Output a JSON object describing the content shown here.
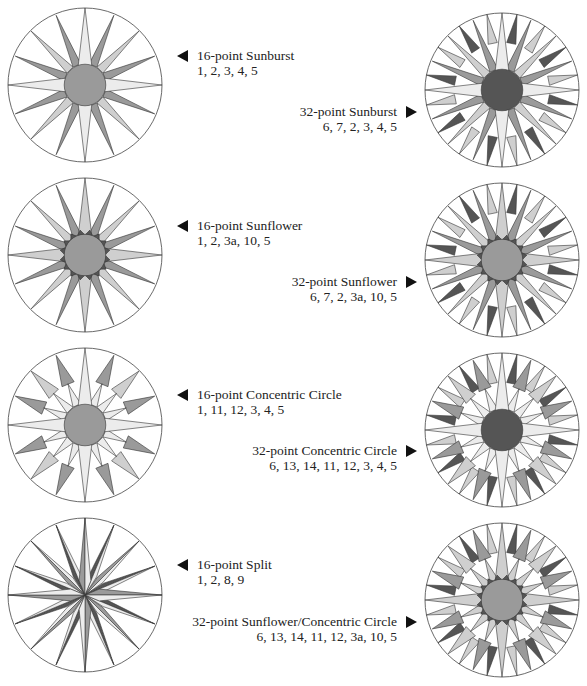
{
  "colors": {
    "ink": "#222222",
    "dark": "#555555",
    "medium": "#9a9a9a",
    "light": "#cfcfcf",
    "pale": "#ececec",
    "white": "#ffffff"
  },
  "diagrams": [
    {
      "id": "16-point-sunburst",
      "title": "16-point Sunburst",
      "codes": "1, 2, 3, 4, 5",
      "side": "left",
      "points": 16,
      "center_fill": "medium",
      "main_fill": "pale",
      "secondary_fill": "light",
      "tertiary_fill": "medium",
      "outer_fill": null,
      "ring_fill": null
    },
    {
      "id": "32-point-sunburst",
      "title": "32-point Sunburst",
      "codes": "6, 7, 2, 3, 4, 5",
      "side": "right",
      "points": 32,
      "center_fill": "dark",
      "main_fill": "pale",
      "secondary_fill": "light",
      "tertiary_fill": "medium",
      "outer_fill": "dark",
      "ring_fill": null
    },
    {
      "id": "16-point-sunflower",
      "title": "16-point Sunflower",
      "codes": "1, 2, 3a, 10, 5",
      "side": "left",
      "points": 16,
      "center_fill": "medium",
      "main_fill": "light",
      "secondary_fill": "light",
      "tertiary_fill": "medium",
      "outer_fill": null,
      "ring_fill": "dark"
    },
    {
      "id": "32-point-sunflower",
      "title": "32-point Sunflower",
      "codes": "6, 7, 2, 3a, 10, 5",
      "side": "right",
      "points": 32,
      "center_fill": "medium",
      "main_fill": "light",
      "secondary_fill": "light",
      "tertiary_fill": "medium",
      "outer_fill": "dark",
      "ring_fill": "dark"
    },
    {
      "id": "16-point-concentric-circle",
      "title": "16-point Concentric Circle",
      "codes": "1, 11, 12, 3, 4, 5",
      "side": "left",
      "points": 16,
      "center_fill": "medium",
      "main_fill": "pale",
      "secondary_fill": "light",
      "tertiary_fill": "medium",
      "outer_fill": null,
      "ring_fill": null,
      "concentric": true
    },
    {
      "id": "32-point-concentric-circle",
      "title": "32-point Concentric Circle",
      "codes": "6, 13, 14, 11, 12, 3, 4, 5",
      "side": "right",
      "points": 32,
      "center_fill": "dark",
      "main_fill": "pale",
      "secondary_fill": "light",
      "tertiary_fill": "medium",
      "outer_fill": "dark",
      "ring_fill": null,
      "concentric": true
    },
    {
      "id": "16-point-split",
      "title": "16-point Split",
      "codes": "1, 2, 8, 9",
      "side": "left",
      "points": 16,
      "center_fill": null,
      "main_fill": "light",
      "secondary_fill": "pale",
      "tertiary_fill": "dark",
      "outer_fill": null,
      "ring_fill": null,
      "split": true
    },
    {
      "id": "32-point-sunflower-concentric-circle",
      "title": "32-point Sunflower/Concentric Circle",
      "codes": "6, 13, 14, 11, 12, 3a, 10, 5",
      "side": "right",
      "points": 32,
      "center_fill": "medium",
      "main_fill": "light",
      "secondary_fill": "light",
      "tertiary_fill": "medium",
      "outer_fill": "dark",
      "ring_fill": "dark",
      "concentric": true
    }
  ],
  "layout": {
    "left": [
      {
        "cx": 85,
        "cy": 85,
        "label_x": 197,
        "label_y": 48
      },
      {
        "cx": 85,
        "cy": 255,
        "label_x": 197,
        "label_y": 218
      },
      {
        "cx": 85,
        "cy": 425,
        "label_x": 197,
        "label_y": 387
      },
      {
        "cx": 85,
        "cy": 595,
        "label_x": 197,
        "label_y": 557
      }
    ],
    "right": [
      {
        "cx": 502,
        "cy": 90,
        "label_right": 190,
        "label_y": 104
      },
      {
        "cx": 502,
        "cy": 260,
        "label_right": 190,
        "label_y": 274
      },
      {
        "cx": 502,
        "cy": 430,
        "label_right": 190,
        "label_y": 443
      },
      {
        "cx": 502,
        "cy": 600,
        "label_right": 190,
        "label_y": 614
      }
    ]
  }
}
